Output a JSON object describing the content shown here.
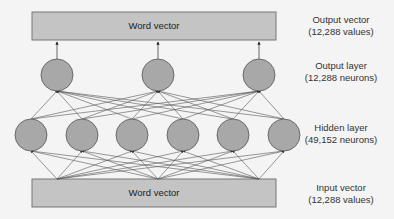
{
  "diagram": {
    "title": "",
    "output_box": {
      "label": "Word vector"
    },
    "input_box": {
      "label": "Word vector"
    },
    "labels": {
      "output_vector": {
        "line1": "Output vector",
        "line2": "(12,288 values)"
      },
      "output_layer": {
        "line1": "Output layer",
        "line2": "(12,288 neurons)"
      },
      "hidden_layer": {
        "line1": "Hidden layer",
        "line2": "(49,152 neurons)"
      },
      "input_vector": {
        "line1": "Input vector",
        "line2": "(12,288 values)"
      }
    },
    "colors": {
      "box_fill": "#c4c4c4",
      "neuron_fill": "#a8a8a8",
      "stroke": "#555555",
      "background": "#f4f4f4"
    },
    "output_neurons": 3,
    "hidden_neurons": 6
  }
}
